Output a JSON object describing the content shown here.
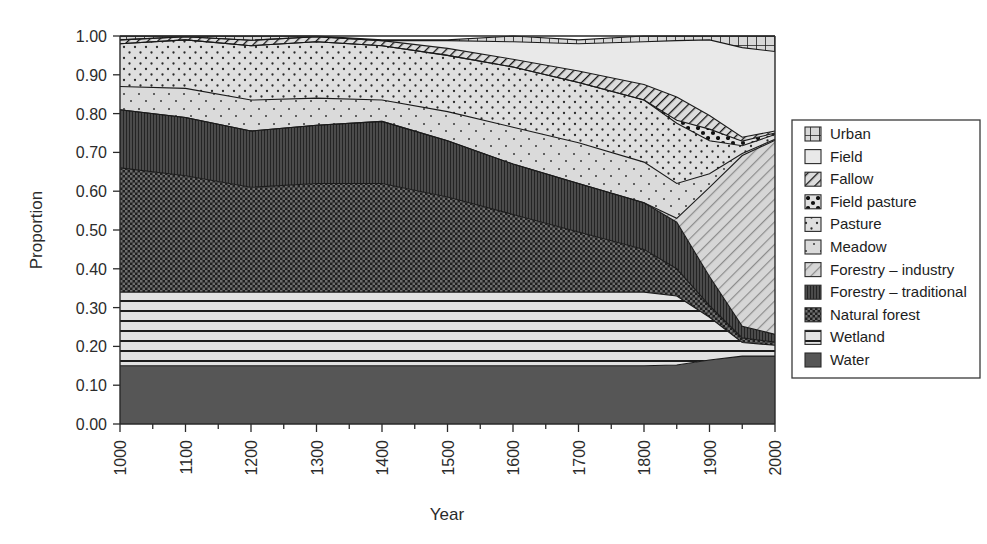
{
  "chart_data": {
    "type": "area",
    "title": "",
    "subtitle": "",
    "xlabel": "Year",
    "ylabel": "Proportion",
    "xlim": [
      1000,
      2000
    ],
    "ylim": [
      0.0,
      1.0
    ],
    "grid": false,
    "stacked": true,
    "stack_order_bottom_to_top": [
      "Water",
      "Wetland",
      "Natural forest",
      "Forestry - traditional",
      "Forestry - industry",
      "Meadow",
      "Pasture",
      "Field pasture",
      "Fallow",
      "Field",
      "Urban"
    ],
    "legend_position": "right",
    "legend_entries": [
      {
        "label": "Urban",
        "pattern": "grid"
      },
      {
        "label": "Field",
        "pattern": "solid-white"
      },
      {
        "label": "Fallow",
        "pattern": "diagonal-hatch-dense"
      },
      {
        "label": "Field pasture",
        "pattern": "coarse-dots"
      },
      {
        "label": "Pasture",
        "pattern": "fine-dots"
      },
      {
        "label": "Meadow",
        "pattern": "sparse-dots"
      },
      {
        "label": "Forestry - industry",
        "pattern": "diagonal-lines"
      },
      {
        "label": "Forestry - traditional",
        "pattern": "vertical-lines-dark"
      },
      {
        "label": "Natural forest",
        "pattern": "checker-dark"
      },
      {
        "label": "Wetland",
        "pattern": "horizontal-lines"
      },
      {
        "label": "Water",
        "pattern": "solid-dark"
      }
    ],
    "x": [
      1000,
      1100,
      1200,
      1300,
      1400,
      1500,
      1600,
      1700,
      1800,
      1850,
      1900,
      1950,
      2000
    ],
    "xtick_labels": [
      "1000",
      "1100",
      "1200",
      "1300",
      "1400",
      "1500",
      "1600",
      "1700",
      "1800",
      "1900",
      "2000"
    ],
    "xticks": [
      1000,
      1100,
      1200,
      1300,
      1400,
      1500,
      1600,
      1700,
      1800,
      1900,
      2000
    ],
    "yticks": [
      0.0,
      0.1,
      0.2,
      0.3,
      0.4,
      0.5,
      0.6,
      0.7,
      0.8,
      0.9,
      1.0
    ],
    "ytick_labels": [
      "0.00",
      "0.10",
      "0.20",
      "0.30",
      "0.40",
      "0.50",
      "0.60",
      "0.70",
      "0.80",
      "0.90",
      "1.00"
    ],
    "series": [
      {
        "name": "Water",
        "values": [
          0.15,
          0.15,
          0.15,
          0.15,
          0.15,
          0.15,
          0.15,
          0.15,
          0.15,
          0.152,
          0.165,
          0.175,
          0.175
        ]
      },
      {
        "name": "Wetland",
        "values": [
          0.19,
          0.19,
          0.19,
          0.19,
          0.19,
          0.19,
          0.19,
          0.19,
          0.19,
          0.178,
          0.11,
          0.035,
          0.028
        ]
      },
      {
        "name": "Natural forest",
        "values": [
          0.32,
          0.3,
          0.27,
          0.28,
          0.28,
          0.245,
          0.2,
          0.155,
          0.11,
          0.07,
          0.03,
          0.012,
          0.008
        ]
      },
      {
        "name": "Forestry - traditional",
        "values": [
          0.15,
          0.15,
          0.145,
          0.15,
          0.16,
          0.145,
          0.13,
          0.125,
          0.12,
          0.12,
          0.075,
          0.03,
          0.02
        ]
      },
      {
        "name": "Forestry - industry",
        "values": [
          0.0,
          0.0,
          0.0,
          0.0,
          0.0,
          0.0,
          0.0,
          0.0,
          0.0,
          0.01,
          0.23,
          0.44,
          0.5
        ]
      },
      {
        "name": "Meadow",
        "values": [
          0.06,
          0.075,
          0.08,
          0.07,
          0.055,
          0.075,
          0.095,
          0.105,
          0.105,
          0.09,
          0.035,
          0.005,
          0.003
        ]
      },
      {
        "name": "Pasture",
        "values": [
          0.11,
          0.125,
          0.14,
          0.145,
          0.14,
          0.145,
          0.155,
          0.155,
          0.16,
          0.155,
          0.085,
          0.02,
          0.012
        ]
      },
      {
        "name": "Field pasture",
        "values": [
          0.0,
          0.0,
          0.0,
          0.0,
          0.0,
          0.0,
          0.0,
          0.0,
          0.0,
          0.008,
          0.03,
          0.012,
          0.004
        ]
      },
      {
        "name": "Fallow",
        "values": [
          0.01,
          0.008,
          0.014,
          0.013,
          0.013,
          0.018,
          0.02,
          0.03,
          0.04,
          0.06,
          0.035,
          0.01,
          0.005
        ]
      },
      {
        "name": "Field",
        "values": [
          0.0,
          0.0,
          0.0,
          0.0,
          0.0,
          0.02,
          0.045,
          0.07,
          0.11,
          0.145,
          0.195,
          0.231,
          0.205
        ]
      },
      {
        "name": "Urban",
        "values": [
          0.01,
          0.002,
          0.011,
          0.002,
          0.002,
          0.002,
          0.015,
          0.01,
          0.015,
          0.012,
          0.01,
          0.03,
          0.04
        ]
      }
    ]
  },
  "axes": {
    "ylabel": "Proportion",
    "xlabel": "Year"
  }
}
